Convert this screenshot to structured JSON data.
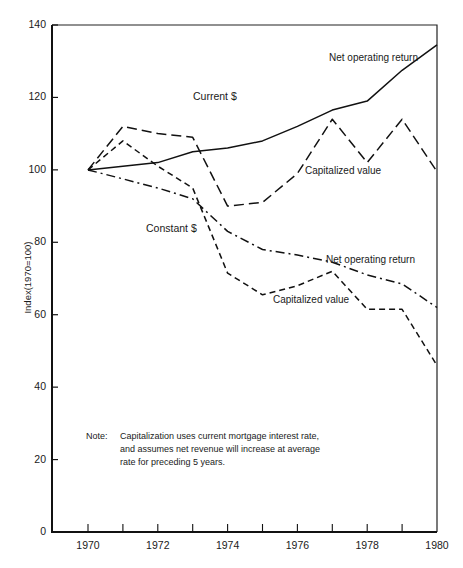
{
  "chart_data": {
    "type": "line",
    "title": "",
    "xlabel": "",
    "ylabel": "Index(1970=100)",
    "xlim": [
      1970,
      1980
    ],
    "ylim": [
      0,
      140
    ],
    "x": [
      1970,
      1971,
      1972,
      1973,
      1974,
      1975,
      1976,
      1977,
      1978,
      1979,
      1980
    ],
    "x_tick_labels": [
      "1970",
      "1972",
      "1974",
      "1976",
      "1978",
      "1980"
    ],
    "y_tick_labels": [
      "0",
      "20",
      "40",
      "60",
      "80",
      "100",
      "120",
      "140"
    ],
    "grid": false,
    "legend": "inline labels",
    "series": [
      {
        "name": "Current $ — Net operating return",
        "style": "solid",
        "values": [
          100,
          101,
          102,
          105,
          106,
          108,
          112,
          116.5,
          119,
          127.5,
          134.5
        ]
      },
      {
        "name": "Current $ — Capitalized value",
        "style": "long-dash",
        "values": [
          100,
          112,
          110,
          109,
          90,
          91,
          99,
          114,
          102,
          114,
          99.5
        ]
      },
      {
        "name": "Constant $ — Net operating return",
        "style": "dash-dot",
        "values": [
          100,
          97.5,
          95,
          92,
          83,
          78,
          76.5,
          74.5,
          71,
          68.5,
          62
        ]
      },
      {
        "name": "Constant $ — Capitalized value",
        "style": "short-dash",
        "values": [
          100,
          108,
          101,
          95,
          71.5,
          65.5,
          68,
          72,
          61.5,
          61.5,
          46
        ]
      }
    ],
    "annotations": [
      "Current $",
      "Net operating return",
      "Capitalized value",
      "Constant $",
      "Net operating return",
      "Capitalized value"
    ],
    "note": "Note: Capitalization uses current mortgage interest rate, and assumes net revenue will increase at average rate for preceding 5 years."
  },
  "labels": {
    "current": "Current $",
    "current_nor": "Net operating return",
    "current_cap": "Capitalized value",
    "constant": "Constant $",
    "constant_nor": "Net operating return",
    "constant_cap": "Capitalized value"
  },
  "note": {
    "head": "Note:",
    "line1": "Capitalization uses current mortgage interest rate,",
    "line2": "and assumes net revenue will increase at average",
    "line3": "rate for preceding 5 years."
  },
  "axis": {
    "ylabel": "Index(1970=100)",
    "yticks": [
      "0",
      "20",
      "40",
      "60",
      "80",
      "100",
      "120",
      "140"
    ],
    "xticks": [
      "1970",
      "1972",
      "1974",
      "1976",
      "1978",
      "1980"
    ]
  }
}
